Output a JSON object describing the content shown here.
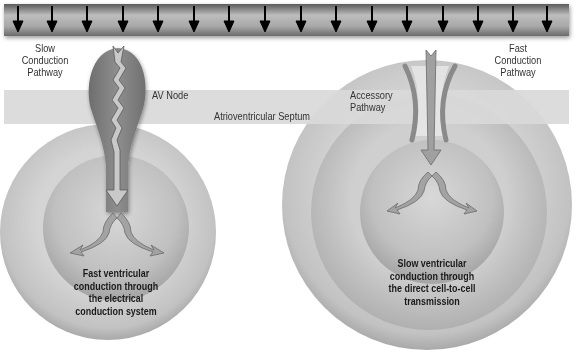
{
  "diagram": {
    "top_bar": {
      "arrow_count": 17,
      "arrow_icon": "down-arrow-icon",
      "color": "#8c8c8c"
    },
    "septum": {
      "label": "Atrioventricular Septum",
      "color": "#d9d9d9"
    },
    "left_panel": {
      "pathway_label": [
        "Slow",
        "Conduction",
        "Pathway"
      ],
      "node_label": "AV Node",
      "caption": [
        "Fast ventricular",
        "conduction through",
        "the electrical",
        "conduction system"
      ],
      "node_color": "#7d7d7d"
    },
    "right_panel": {
      "pathway_label": [
        "Fast",
        "Conduction",
        "Pathway"
      ],
      "accessory_label": [
        "Accessory",
        "Pathway"
      ],
      "caption": [
        "Slow ventricular",
        "conduction through",
        "the direct cell-to-cell",
        "transmission"
      ]
    },
    "colors": {
      "outer_ring": "#c8c8c8",
      "inner_circle": "#b4b4b4",
      "arrow_fill": "#9a9a9a",
      "text": "#333333"
    }
  }
}
